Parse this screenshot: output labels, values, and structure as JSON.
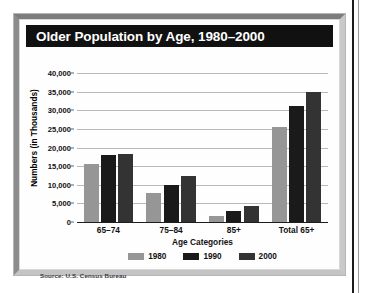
{
  "figure": {
    "title": "Older Population by Age, 1980–2000",
    "source": "Source: U.S. Census Bureau"
  },
  "chart_data": {
    "type": "bar",
    "title": "Older Population by Age, 1980–2000",
    "xlabel": "Age Categories",
    "ylabel": "Numbers (in Thousands)",
    "categories": [
      "65–74",
      "75–84",
      "85+",
      "Total 65+"
    ],
    "series": [
      {
        "name": "1980",
        "color": "#969696",
        "values": [
          15581,
          7729,
          1559,
          25549
        ]
      },
      {
        "name": "1990",
        "color": "#1a1a1a",
        "values": [
          18107,
          10055,
          3080,
          31242
        ]
      },
      {
        "name": "2000",
        "color": "#333333",
        "values": [
          18391,
          12361,
          4240,
          34992
        ]
      }
    ],
    "ylim": [
      0,
      40000
    ],
    "yticks": [
      0,
      5000,
      10000,
      15000,
      20000,
      25000,
      30000,
      35000,
      40000
    ],
    "ytick_labels": [
      "0",
      "5,000",
      "10,000",
      "15,000",
      "20,000",
      "25,000",
      "30,000",
      "35,000",
      "40,000"
    ],
    "grid": true,
    "legend_position": "bottom"
  }
}
